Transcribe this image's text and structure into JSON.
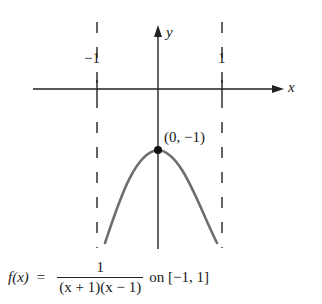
{
  "diagram": {
    "axes": {
      "x_label": "x",
      "y_label": "y"
    },
    "asymptotes": [
      {
        "label": "−1",
        "x_value": -1,
        "style": "dashed"
      },
      {
        "label": "1",
        "x_value": 1,
        "style": "dashed"
      }
    ],
    "point": {
      "label": "(0, −1)",
      "x": 0,
      "y": -1
    },
    "curve": {
      "description": "downward opening arch between vertical asymptotes",
      "color": "#6e6e6e"
    },
    "formula": {
      "lhs": "f(x)",
      "equals": "=",
      "numerator": "1",
      "denominator": "(x + 1)(x − 1)",
      "suffix": "on [−1, 1]"
    }
  }
}
